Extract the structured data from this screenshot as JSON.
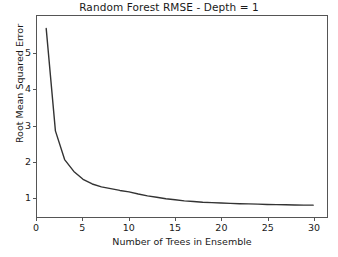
{
  "chart_data": {
    "type": "line",
    "title": "Random Forest RMSE - Depth = 1",
    "xlabel": "Number of Trees in Ensemble",
    "ylabel": "Root Mean Squared Error",
    "xlim": [
      0,
      31.5
    ],
    "ylim": [
      0.45,
      6.05
    ],
    "grid": false,
    "legend": null,
    "line_color": "#333333",
    "x": [
      1,
      2,
      3,
      4,
      5,
      6,
      7,
      8,
      9,
      10,
      11,
      12,
      13,
      14,
      15,
      16,
      17,
      18,
      19,
      20,
      21,
      22,
      23,
      24,
      25,
      26,
      27,
      28,
      29,
      30
    ],
    "values": [
      5.7,
      2.85,
      2.05,
      1.72,
      1.5,
      1.37,
      1.29,
      1.24,
      1.19,
      1.15,
      1.09,
      1.04,
      1.0,
      0.96,
      0.93,
      0.9,
      0.88,
      0.86,
      0.85,
      0.84,
      0.83,
      0.82,
      0.815,
      0.81,
      0.8,
      0.795,
      0.79,
      0.785,
      0.78,
      0.78
    ],
    "series": [
      {
        "name": "RMSE",
        "values": [
          5.7,
          2.85,
          2.05,
          1.72,
          1.5,
          1.37,
          1.29,
          1.24,
          1.19,
          1.15,
          1.09,
          1.04,
          1.0,
          0.96,
          0.93,
          0.9,
          0.88,
          0.86,
          0.85,
          0.84,
          0.83,
          0.82,
          0.815,
          0.81,
          0.8,
          0.795,
          0.79,
          0.785,
          0.78,
          0.78
        ]
      }
    ],
    "xticks": [
      {
        "value": 0,
        "label": "0"
      },
      {
        "value": 5,
        "label": "5"
      },
      {
        "value": 10,
        "label": "10"
      },
      {
        "value": 15,
        "label": "15"
      },
      {
        "value": 20,
        "label": "20"
      },
      {
        "value": 25,
        "label": "25"
      },
      {
        "value": 30,
        "label": "30"
      }
    ],
    "yticks": [
      {
        "value": 1,
        "label": "1"
      },
      {
        "value": 2,
        "label": "2"
      },
      {
        "value": 3,
        "label": "3"
      },
      {
        "value": 4,
        "label": "4"
      },
      {
        "value": 5,
        "label": "5"
      }
    ]
  },
  "figure": {
    "background_color": "#ffffff",
    "axis_color": "#555555",
    "text_color": "#1a1a1a"
  }
}
